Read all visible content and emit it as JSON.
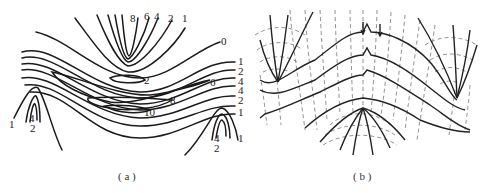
{
  "panels": [
    {
      "id": "a",
      "caption": "( a )",
      "description": "Contour (isoline) map with labeled values",
      "labels": {
        "top": [
          "8",
          "6",
          "4",
          "2",
          "1"
        ],
        "top_right": "0",
        "right": [
          "1",
          "2",
          "4",
          "4",
          "2",
          "1",
          "1"
        ],
        "center": [
          "2",
          "6",
          "8",
          "10"
        ],
        "left_lobe": [
          "1",
          "4",
          "2"
        ],
        "right_lobe": [
          "4",
          "2"
        ]
      }
    },
    {
      "id": "b",
      "caption": "( b )",
      "description": "Solid flow lines with orthogonal dashed equipotential lines"
    }
  ]
}
